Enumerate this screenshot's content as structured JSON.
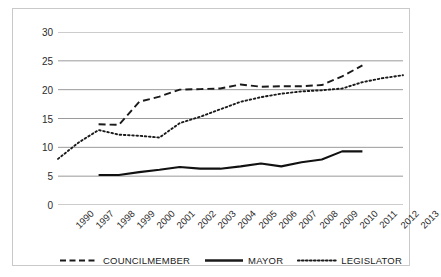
{
  "chart_data": {
    "type": "line",
    "title": "",
    "xlabel": "",
    "ylabel": "",
    "ylim": [
      0,
      30
    ],
    "yticks": [
      0,
      5,
      10,
      15,
      20,
      25,
      30
    ],
    "grid": true,
    "legend_position": "bottom",
    "categories": [
      "1990",
      "1997",
      "1998",
      "1999",
      "2000",
      "2001",
      "2002",
      "2003",
      "2004",
      "2005",
      "2006",
      "2007",
      "2008",
      "2009",
      "2010",
      "2011",
      "2012",
      "2013"
    ],
    "series": [
      {
        "name": "COUNCILMEMBER",
        "style": "dashed",
        "color": "#1a1a1a",
        "values": [
          null,
          null,
          14.0,
          13.9,
          17.9,
          18.8,
          20.0,
          20.1,
          20.2,
          20.9,
          20.5,
          20.6,
          20.6,
          20.8,
          22.3,
          24.2,
          null,
          null
        ]
      },
      {
        "name": "MAYOR",
        "style": "solid",
        "color": "#111111",
        "values": [
          null,
          null,
          5.2,
          5.2,
          5.7,
          6.1,
          6.6,
          6.3,
          6.3,
          6.7,
          7.2,
          6.7,
          7.4,
          7.9,
          9.3,
          9.3,
          null,
          null
        ]
      },
      {
        "name": "LEGISLATOR",
        "style": "dotted",
        "color": "#1a1a1a",
        "values": [
          8.0,
          10.8,
          13.0,
          12.2,
          12.0,
          11.7,
          14.2,
          15.3,
          16.6,
          17.9,
          18.7,
          19.3,
          19.7,
          19.9,
          20.2,
          21.3,
          22.0,
          22.5
        ]
      }
    ]
  },
  "legend": {
    "items": [
      {
        "label": "COUNCILMEMBER",
        "style": "dashed"
      },
      {
        "label": "MAYOR",
        "style": "solid"
      },
      {
        "label": "LEGISLATOR",
        "style": "dotted"
      }
    ]
  }
}
